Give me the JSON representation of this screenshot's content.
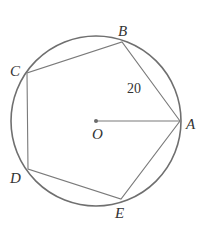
{
  "diagram": {
    "colors": {
      "stroke": "#7a7a7a",
      "circle": "#6f6f6f",
      "text": "#333333",
      "background": "#ffffff"
    },
    "circle": {
      "center": "O",
      "cx": 96,
      "cy": 121,
      "r": 85
    },
    "points": {
      "O": {
        "label": "O",
        "x": 96,
        "y": 121,
        "lx": 92,
        "ly": 139
      },
      "A": {
        "label": "A",
        "x": 180,
        "y": 121,
        "lx": 186,
        "ly": 129
      },
      "B": {
        "label": "B",
        "x": 122,
        "y": 42,
        "lx": 118,
        "ly": 36
      },
      "C": {
        "label": "C",
        "x": 27,
        "y": 73,
        "lx": 10,
        "ly": 76
      },
      "D": {
        "label": "D",
        "x": 28,
        "y": 169,
        "lx": 10,
        "ly": 183
      },
      "E": {
        "label": "E",
        "x": 121,
        "y": 199,
        "lx": 115,
        "ly": 218
      }
    },
    "segments": [
      {
        "from": "A",
        "to": "B"
      },
      {
        "from": "B",
        "to": "C"
      },
      {
        "from": "C",
        "to": "D"
      },
      {
        "from": "D",
        "to": "E"
      },
      {
        "from": "E",
        "to": "A"
      },
      {
        "from": "O",
        "to": "A"
      }
    ],
    "annotations": [
      {
        "text": "20",
        "refers_to": "AB",
        "x": 127,
        "y": 93
      }
    ]
  }
}
